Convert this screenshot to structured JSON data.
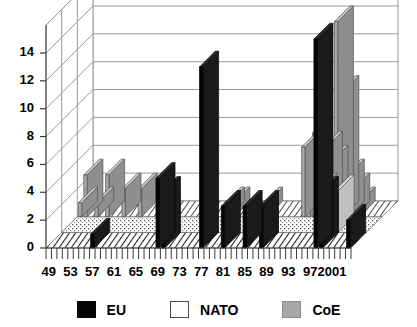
{
  "chart_data": {
    "type": "bar",
    "title": "",
    "subtitle": "",
    "xlabel": "",
    "ylabel": "",
    "ylim": [
      0,
      16
    ],
    "yticks": [
      0,
      2,
      4,
      6,
      8,
      10,
      12,
      14
    ],
    "ytick_labels": [
      "0",
      "2",
      "4",
      "6",
      "8",
      "10",
      "12",
      "14"
    ],
    "grid": true,
    "projection": "3d-depth",
    "legend_position": "bottom",
    "legend": [
      "EU",
      "NATO",
      "CoE"
    ],
    "series_colors": {
      "EU": "#050505",
      "NATO": "#ffffff",
      "CoE": "#a8a8a8"
    },
    "x": [
      1949,
      1950,
      1951,
      1952,
      1953,
      1954,
      1955,
      1956,
      1957,
      1958,
      1959,
      1960,
      1961,
      1962,
      1963,
      1964,
      1965,
      1966,
      1967,
      1968,
      1969,
      1970,
      1971,
      1972,
      1973,
      1974,
      1975,
      1976,
      1977,
      1978,
      1979,
      1980,
      1981,
      1982,
      1983,
      1984,
      1985,
      1986,
      1987,
      1988,
      1989,
      1990,
      1991,
      1992,
      1993,
      1994,
      1995,
      1996,
      1997,
      1998,
      1999,
      2000,
      2001,
      2002,
      2003,
      2004
    ],
    "xtick_labels": [
      "49",
      "53",
      "57",
      "61",
      "65",
      "69",
      "73",
      "77",
      "81",
      "85",
      "89",
      "93",
      "97",
      "2001"
    ],
    "xtick_years": [
      1949,
      1953,
      1957,
      1961,
      1965,
      1969,
      1973,
      1977,
      1981,
      1985,
      1989,
      1993,
      1997,
      2001
    ],
    "series": [
      {
        "name": "EU",
        "values": [
          0,
          0,
          0,
          0,
          0,
          0,
          0,
          0,
          1,
          0,
          0,
          0,
          0,
          0,
          0,
          0,
          0,
          0,
          0,
          0,
          5,
          4,
          0,
          0,
          0,
          0,
          0,
          0,
          13,
          0,
          0,
          0,
          3,
          0,
          0,
          0,
          3,
          0,
          0,
          3,
          0,
          0,
          0,
          0,
          0,
          0,
          0,
          0,
          0,
          15,
          4,
          0,
          0,
          0,
          0,
          2
        ]
      },
      {
        "name": "NATO",
        "values": [
          0,
          0,
          0,
          0,
          0,
          0,
          0,
          0,
          0,
          0,
          0,
          0,
          0,
          0,
          0,
          0,
          0,
          0,
          0,
          0,
          0,
          0,
          0,
          0,
          0,
          0,
          0,
          0,
          0,
          0,
          0,
          0,
          0,
          0,
          0,
          0,
          0,
          0,
          0,
          0,
          0,
          0,
          0,
          0,
          0,
          0,
          0,
          0,
          0,
          0,
          3,
          0,
          0,
          0,
          0,
          0
        ]
      },
      {
        "name": "CoE",
        "values": [
          1,
          3,
          0,
          1,
          0,
          3,
          0,
          0,
          2,
          0,
          0,
          2,
          0,
          0,
          0,
          1,
          0,
          0,
          0,
          0,
          0,
          0,
          0,
          0,
          0,
          0,
          0,
          1,
          1,
          0,
          0,
          0,
          0,
          0,
          1,
          0,
          0,
          0,
          0,
          0,
          0,
          5,
          5,
          6,
          2,
          5,
          4,
          14,
          9,
          3,
          2,
          1,
          0,
          0,
          0,
          0
        ]
      }
    ]
  },
  "legend": {
    "items": [
      {
        "label": "EU",
        "swatch": "eu"
      },
      {
        "label": "NATO",
        "swatch": "nato"
      },
      {
        "label": "CoE",
        "swatch": "coe"
      }
    ]
  }
}
